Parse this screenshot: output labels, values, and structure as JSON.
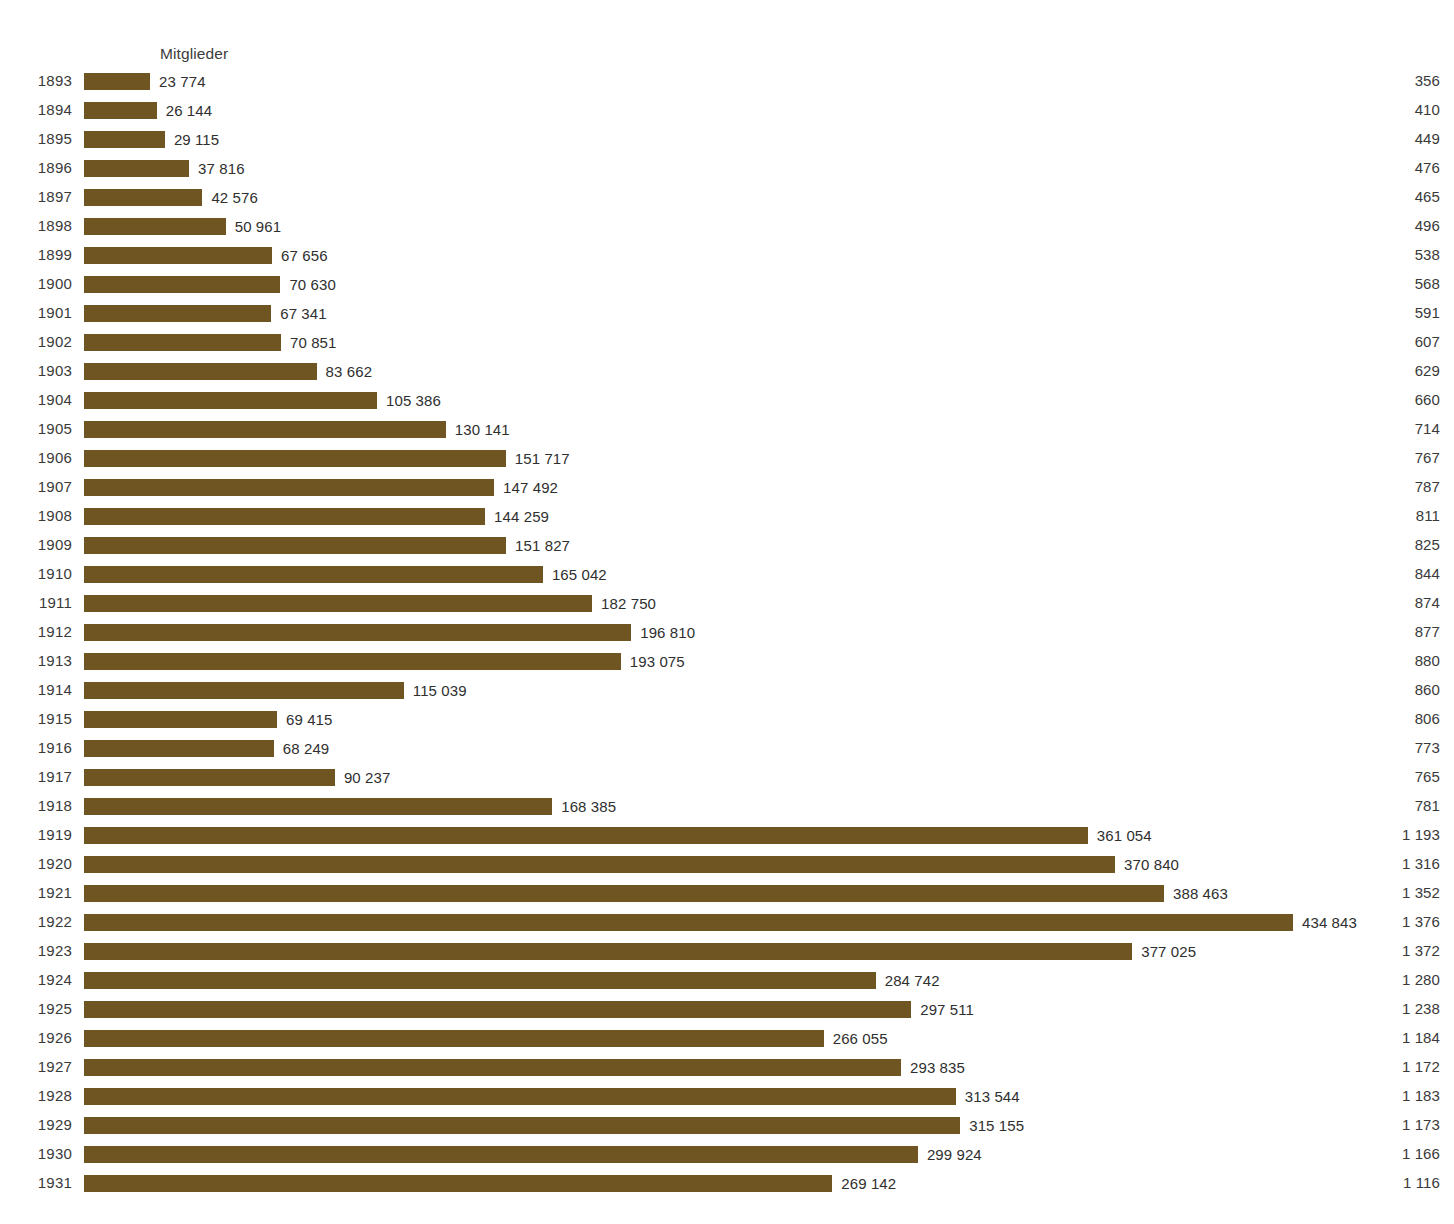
{
  "chart_data": {
    "type": "bar",
    "orientation": "horizontal",
    "title": "",
    "xlabel": "",
    "ylabel": "",
    "grid": false,
    "legend": null,
    "value_column_header": "Mitglieder",
    "right_column_header": "",
    "categories": [
      "1893",
      "1894",
      "1895",
      "1896",
      "1897",
      "1898",
      "1899",
      "1900",
      "1901",
      "1902",
      "1903",
      "1904",
      "1905",
      "1906",
      "1907",
      "1908",
      "1909",
      "1910",
      "1911",
      "1912",
      "1913",
      "1914",
      "1915",
      "1916",
      "1917",
      "1918",
      "1919",
      "1920",
      "1921",
      "1922",
      "1923",
      "1924",
      "1925",
      "1926",
      "1927",
      "1928",
      "1929",
      "1930",
      "1931"
    ],
    "series": [
      {
        "name": "Mitglieder",
        "values": [
          23774,
          26144,
          29115,
          37816,
          42576,
          50961,
          67656,
          70630,
          67341,
          70851,
          83662,
          105386,
          130141,
          151717,
          147492,
          144259,
          151827,
          165042,
          182750,
          196810,
          193075,
          115039,
          69415,
          68249,
          90237,
          168385,
          361054,
          370840,
          388463,
          434843,
          377025,
          284742,
          297511,
          266055,
          293835,
          313544,
          315155,
          299924,
          269142
        ],
        "labels": [
          "23 774",
          "26 144",
          "29 115",
          "37 816",
          "42 576",
          "50 961",
          "67 656",
          "70 630",
          "67 341",
          "70 851",
          "83 662",
          "105 386",
          "130 141",
          "151 717",
          "147 492",
          "144 259",
          "151 827",
          "165 042",
          "182 750",
          "196 810",
          "193 075",
          "115 039",
          "69 415",
          "68 249",
          "90 237",
          "168 385",
          "361 054",
          "370 840",
          "388 463",
          "434 843",
          "377 025",
          "284 742",
          "297 511",
          "266 055",
          "293 835",
          "313 544",
          "315 155",
          "299 924",
          "269 142"
        ],
        "color": "#6e5522"
      },
      {
        "name": "right-column",
        "values": [
          356,
          410,
          449,
          476,
          465,
          496,
          538,
          568,
          591,
          607,
          629,
          660,
          714,
          767,
          787,
          811,
          825,
          844,
          874,
          877,
          880,
          860,
          806,
          773,
          765,
          781,
          1193,
          1316,
          1352,
          1376,
          1372,
          1280,
          1238,
          1184,
          1172,
          1183,
          1173,
          1166,
          1116
        ],
        "labels": [
          "356",
          "410",
          "449",
          "476",
          "465",
          "496",
          "538",
          "568",
          "591",
          "607",
          "629",
          "660",
          "714",
          "767",
          "787",
          "811",
          "825",
          "844",
          "874",
          "877",
          "880",
          "860",
          "806",
          "773",
          "765",
          "781",
          "1 193",
          "1 316",
          "1 352",
          "1 376",
          "1 372",
          "1 280",
          "1 238",
          "1 184",
          "1 172",
          "1 183",
          "1 173",
          "1 166",
          "1 116"
        ]
      }
    ],
    "xlim": [
      0,
      434843
    ],
    "max_bar_px": 1209,
    "bar_origin_px": 84
  },
  "colors": {
    "bar": "#6e5522",
    "text": "#3a3a3a",
    "background": "#ffffff"
  }
}
